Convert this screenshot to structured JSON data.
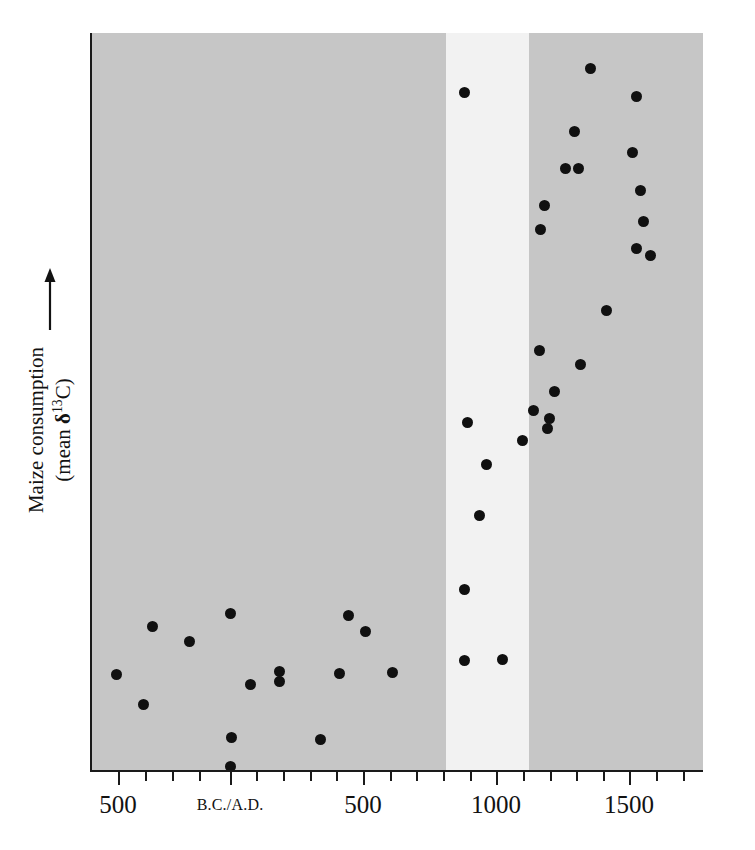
{
  "figure": {
    "background_color": "#ffffff",
    "panel_color": "#c6c6c6",
    "band_color": "#f2f2f2",
    "point_color": "#101010"
  },
  "axes": {
    "y_label_line1": "Maize consumption",
    "y_label_line2_prefix": "(mean ",
    "y_label_delta": "δ",
    "y_label_superscript": "13",
    "y_label_line2_suffix": "C)",
    "y_arrow_icon": "up-arrow-icon",
    "x_tick_labels": [
      {
        "text": "500",
        "x": 118
      },
      {
        "text": "B.C./A.D.",
        "x": 230,
        "era": true
      },
      {
        "text": "500",
        "x": 363
      },
      {
        "text": "1000",
        "x": 496
      },
      {
        "text": "1500",
        "x": 629
      }
    ],
    "x_ticks_px": [
      118,
      145,
      172,
      199,
      230,
      256,
      283,
      310,
      336,
      363,
      390,
      416,
      443,
      470,
      496,
      523,
      550,
      576,
      603,
      629,
      656,
      683
    ],
    "x_major_ticks_px": [
      118,
      230,
      363,
      496,
      629
    ],
    "highlight_band": {
      "x_start": 444,
      "x_end": 527
    }
  },
  "chart_data": {
    "type": "scatter",
    "title": "",
    "xlabel": "",
    "ylabel": "Maize consumption (mean δ13C)",
    "xlim": [
      -620,
      1680
    ],
    "ylim": [
      0,
      100
    ],
    "grid": false,
    "legend": null,
    "annotations": [
      {
        "type": "vertical-band",
        "label": "transition interval",
        "x_start": 800,
        "x_end": 1110,
        "color": "#f2f2f2"
      }
    ],
    "x_axis_note": "Calendar years; negative values are B.C., positive values are A.D.",
    "y_axis_note": "Relative maize consumption increases upward; axis is unlabeled with only an arrow.",
    "points_px": [
      {
        "x": 114,
        "y": 674
      },
      {
        "x": 141,
        "y": 704
      },
      {
        "x": 150,
        "y": 626
      },
      {
        "x": 187,
        "y": 641
      },
      {
        "x": 228,
        "y": 613
      },
      {
        "x": 229,
        "y": 737
      },
      {
        "x": 228,
        "y": 766
      },
      {
        "x": 248,
        "y": 684
      },
      {
        "x": 277,
        "y": 671
      },
      {
        "x": 277,
        "y": 681
      },
      {
        "x": 318,
        "y": 739
      },
      {
        "x": 337,
        "y": 673
      },
      {
        "x": 346,
        "y": 615
      },
      {
        "x": 363,
        "y": 631
      },
      {
        "x": 390,
        "y": 672
      },
      {
        "x": 462,
        "y": 660
      },
      {
        "x": 462,
        "y": 589
      },
      {
        "x": 500,
        "y": 659
      },
      {
        "x": 477,
        "y": 515
      },
      {
        "x": 484,
        "y": 464
      },
      {
        "x": 465,
        "y": 422
      },
      {
        "x": 462,
        "y": 92
      },
      {
        "x": 531,
        "y": 410
      },
      {
        "x": 520,
        "y": 440
      },
      {
        "x": 545,
        "y": 428
      },
      {
        "x": 552,
        "y": 391
      },
      {
        "x": 547,
        "y": 418
      },
      {
        "x": 537,
        "y": 350
      },
      {
        "x": 542,
        "y": 205
      },
      {
        "x": 538,
        "y": 229
      },
      {
        "x": 563,
        "y": 168
      },
      {
        "x": 576,
        "y": 168
      },
      {
        "x": 572,
        "y": 131
      },
      {
        "x": 578,
        "y": 364
      },
      {
        "x": 588,
        "y": 68
      },
      {
        "x": 604,
        "y": 310
      },
      {
        "x": 630,
        "y": 152
      },
      {
        "x": 634,
        "y": 96
      },
      {
        "x": 638,
        "y": 190
      },
      {
        "x": 641,
        "y": 221
      },
      {
        "x": 634,
        "y": 248
      },
      {
        "x": 648,
        "y": 255
      }
    ],
    "point_count": 42
  }
}
